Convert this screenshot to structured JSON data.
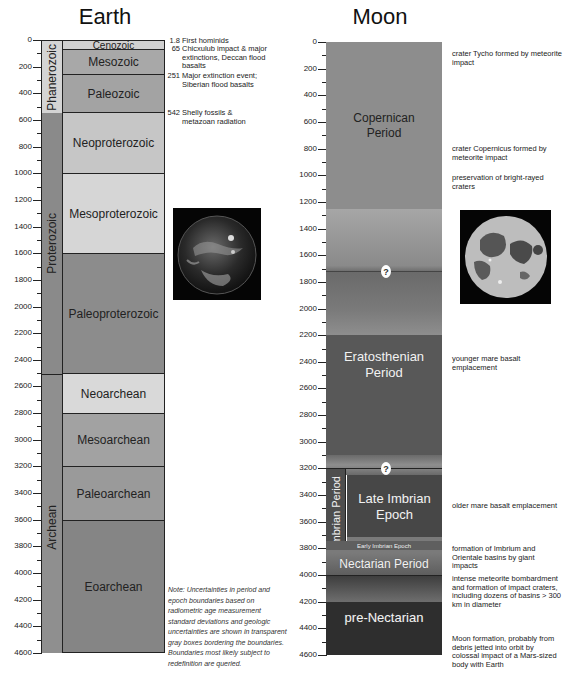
{
  "earth": {
    "title": "Earth",
    "axis": {
      "min": 0,
      "max": 4600,
      "ticks": [
        "0",
        "200",
        "400",
        "600",
        "800",
        "1000",
        "1200",
        "1400",
        "1600",
        "1800",
        "2000",
        "2200",
        "2400",
        "2600",
        "2800",
        "3000",
        "3200",
        "3400",
        "3600",
        "3800",
        "4000",
        "4200",
        "4400",
        "4600"
      ]
    },
    "eons": [
      {
        "label": "Phanerozoic",
        "start": 0,
        "end": 542,
        "color": "#d4d4d4"
      },
      {
        "label": "Proterozoic",
        "start": 542,
        "end": 2500,
        "color": "#8a8a8a"
      },
      {
        "label": "Archean",
        "start": 2500,
        "end": 4600,
        "color": "#8f8f8f"
      }
    ],
    "eras": [
      {
        "label": "Cenozoic",
        "start": 0,
        "end": 65,
        "color": "#d0d0d0"
      },
      {
        "label": "Mesozoic",
        "start": 65,
        "end": 251,
        "color": "#a8a8a8"
      },
      {
        "label": "Paleozoic",
        "start": 251,
        "end": 542,
        "color": "#a3a3a3"
      },
      {
        "label": "Neoproterozoic",
        "start": 542,
        "end": 1000,
        "color": "#c6c6c6"
      },
      {
        "label": "Mesoproterozoic",
        "start": 1000,
        "end": 1600,
        "color": "#d6d6d6"
      },
      {
        "label": "Paleoproterozoic",
        "start": 1600,
        "end": 2500,
        "color": "#8c8c8c"
      },
      {
        "label": "Neoarchean",
        "start": 2500,
        "end": 2800,
        "color": "#d9d9d9"
      },
      {
        "label": "Mesoarchean",
        "start": 2800,
        "end": 3200,
        "color": "#a2a2a2"
      },
      {
        "label": "Paleoarchean",
        "start": 3200,
        "end": 3600,
        "color": "#9a9a9a"
      },
      {
        "label": "Eoarchean",
        "start": 3600,
        "end": 4600,
        "color": "#858585"
      }
    ],
    "events": [
      {
        "age": "1.8",
        "text": "First hominids"
      },
      {
        "age": "65",
        "text": "Chicxulub impact & major extinctions, Deccan flood basalts"
      },
      {
        "age": "251",
        "text": "Major extinction event; Siberian flood basalts"
      },
      {
        "age": "542",
        "text": "Shelly fossils & metazoan radiation"
      }
    ],
    "note": "Note: Uncertainties in period and epoch boundaries based on radiometric age measurement standard deviations and geologic uncertainties are shown in transparent gray boxes bordering the boundaries. Boundaries most likely subject to redefinition are queried.",
    "image_label": "earth-globe-image"
  },
  "moon": {
    "title": "Moon",
    "axis": {
      "min": 0,
      "max": 4600,
      "ticks": [
        "0",
        "200",
        "400",
        "600",
        "800",
        "1000",
        "1200",
        "1400",
        "1600",
        "1800",
        "2000",
        "2200",
        "2400",
        "2600",
        "2800",
        "3000",
        "3200",
        "3400",
        "3600",
        "3800",
        "4000",
        "4200",
        "4400",
        "4600"
      ]
    },
    "periods": [
      {
        "label": "Copernican Period",
        "start": 0,
        "end": 1250
      },
      {
        "label": "Eratosthenian Period",
        "start": 2200,
        "end": 3100
      },
      {
        "label": "Imbrian Period",
        "start": 3200,
        "end": 3850
      },
      {
        "label": "Late Imbrian Epoch",
        "start": 3240,
        "end": 3720
      },
      {
        "label": "Early Imbrian Epoch",
        "start": 3750,
        "end": 3820
      },
      {
        "label": "Nectarian Period",
        "start": 3850,
        "end": 4000
      },
      {
        "label": "pre-Nectarian",
        "start": 4200,
        "end": 4600
      }
    ],
    "uncertainty_marker": "?",
    "events": [
      {
        "text": "crater Tycho formed by meteorite impact"
      },
      {
        "text": "crater Copernicus formed by meteorite impact"
      },
      {
        "text": "preservation of bright-rayed craters"
      },
      {
        "text": "younger mare basalt emplacement"
      },
      {
        "text": "older mare basalt emplacement"
      },
      {
        "text": "formation of Imbrium and Orientale basins by giant impacts"
      },
      {
        "text": "intense meteorite bombardment and formation of impact craters, including dozens of basins > 300 km in diameter"
      },
      {
        "text": "Moon formation, probably from debris jetted into orbit by colossal impact of a Mars-sized body with Earth"
      }
    ],
    "image_label": "full-moon-image"
  }
}
